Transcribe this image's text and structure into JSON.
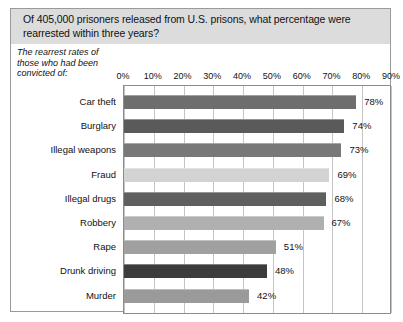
{
  "chart_data": {
    "type": "bar",
    "orientation": "horizontal",
    "title": "Of 405,000 prisoners released from U.S. prisons, what percentage were rearrested within three years?",
    "subtitle": "The rearrest rates of those who had been convicted of:",
    "categories": [
      "Car theft",
      "Burglary",
      "Illegal weapons",
      "Fraud",
      "Illegal drugs",
      "Robbery",
      "Rape",
      "Drunk driving",
      "Murder"
    ],
    "values": [
      78,
      74,
      73,
      69,
      68,
      67,
      51,
      48,
      42
    ],
    "value_labels": [
      "78%",
      "74%",
      "73%",
      "69%",
      "68%",
      "67%",
      "51%",
      "48%",
      "42%"
    ],
    "bar_colors": [
      "#6e6e6e",
      "#5a5a5a",
      "#787878",
      "#d3d3d3",
      "#5f5f5f",
      "#b0b0b0",
      "#a0a0a0",
      "#3c3c3c",
      "#9a9a9a"
    ],
    "xlabel": "",
    "ylabel": "",
    "xlim": [
      0,
      90
    ],
    "xticks": [
      0,
      10,
      20,
      30,
      40,
      50,
      60,
      70,
      80,
      90
    ],
    "xtick_labels": [
      "0%",
      "10%",
      "20%",
      "30%",
      "40%",
      "50%",
      "60%",
      "70%",
      "80%",
      "90%"
    ],
    "grid": true,
    "grid_axis": "x",
    "legend": false,
    "header_background": "#dcdcdc",
    "plot_background": "#ffffff",
    "border_color": "#9a9a9a"
  }
}
